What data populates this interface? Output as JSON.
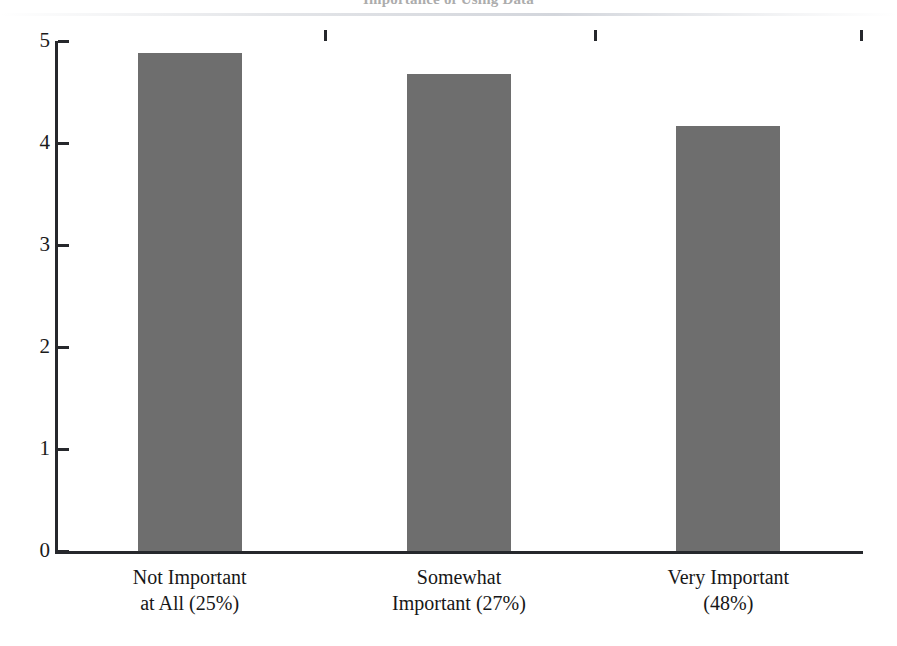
{
  "chart_data": {
    "type": "bar",
    "title": "Importance of Using Data",
    "subtitle": "",
    "xlabel": "",
    "ylabel": "",
    "categories": [
      "Not Important\nat All (25%)",
      "Somewhat\nImportant (27%)",
      "Very Important\n(48%)"
    ],
    "category_lines": [
      [
        "Not Important",
        "at All (25%)"
      ],
      [
        "Somewhat",
        "Important (27%)"
      ],
      [
        "Very Important",
        "(48%)"
      ]
    ],
    "category_percents": [
      "25%",
      "27%",
      "48%"
    ],
    "values": [
      4.88,
      4.68,
      4.17
    ],
    "ylim": [
      0,
      5
    ],
    "yticks": [
      0,
      1,
      2,
      3,
      4,
      5
    ],
    "ytick_labels": [
      "0",
      "1",
      "2",
      "3",
      "4",
      "5"
    ],
    "grid": false,
    "legend": "none",
    "bar_color": "#6e6e6e",
    "axis_color": "#26282c",
    "background_color": "#ffffff"
  },
  "axis": {
    "y_labels": [
      "5",
      "4",
      "3",
      "2",
      "1",
      "0"
    ]
  }
}
